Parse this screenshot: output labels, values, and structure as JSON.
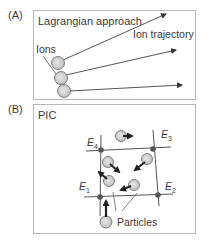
{
  "panelA": {
    "tag": "(A)",
    "title": "Lagrangian approach",
    "ion_label": "Ions",
    "trajectory_label": "Ion trajectory"
  },
  "panelB": {
    "tag": "(B)",
    "title": "PIC",
    "nodes": [
      {
        "id": "E1",
        "base": "E",
        "sub": "1"
      },
      {
        "id": "E2",
        "base": "E",
        "sub": "2"
      },
      {
        "id": "E3",
        "base": "E",
        "sub": "3"
      },
      {
        "id": "E4",
        "base": "E",
        "sub": "4"
      }
    ],
    "particles_label": "Particles"
  },
  "colors": {
    "line": "#555555",
    "particle_fill": "#cfcfcf",
    "particle_inner": "#e4e4e4",
    "node_fill": "#555555",
    "arrow": "#222222",
    "border": "#b8b8b8"
  }
}
